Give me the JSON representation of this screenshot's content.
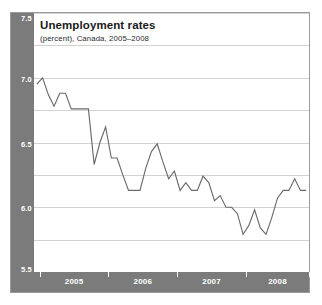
{
  "chart_data": {
    "type": "line",
    "title": "Unemployment rates",
    "subtitle": "(percent), Canada, 2005–2008",
    "xlabel": "",
    "ylabel": "percent",
    "ylim": [
      5.5,
      7.5
    ],
    "yticks": [
      "7.5",
      "7.0",
      "6.5",
      "6.0",
      "5.5"
    ],
    "ytick_values": [
      7.5,
      7.0,
      6.5,
      6.0,
      5.5
    ],
    "gridline_values": [
      7.5,
      7.25,
      7.0,
      6.75,
      6.5,
      6.25,
      6.0,
      5.75,
      5.5
    ],
    "grid": true,
    "legend": "none",
    "xtick_labels": [
      "2005",
      "2006",
      "2007",
      "2008"
    ],
    "xtick_label_positions": [
      6.5,
      18.5,
      30.5,
      42.0
    ],
    "xtick_mark_positions": [
      0.5,
      12.5,
      24.5,
      36.5,
      47.5
    ],
    "line_color": "#6b6b6b",
    "axis_band_color": "#7b7b7b",
    "grid_color": "#d2d2d2",
    "frame_color": "#9a9a9a",
    "background_color": "#ffffff",
    "x": [
      0,
      1,
      2,
      3,
      4,
      5,
      6,
      7,
      8,
      9,
      10,
      11,
      12,
      13,
      14,
      15,
      16,
      17,
      18,
      19,
      20,
      21,
      22,
      23,
      24,
      25,
      26,
      27,
      28,
      29,
      30,
      31,
      32,
      33,
      34,
      35,
      36,
      37,
      38,
      39,
      40,
      41,
      42,
      43,
      44,
      45,
      46,
      47
    ],
    "series": [
      {
        "name": "Unemployment rate",
        "values": [
          6.95,
          7.0,
          6.87,
          6.78,
          6.88,
          6.88,
          6.76,
          6.76,
          6.76,
          6.76,
          6.33,
          6.5,
          6.62,
          6.38,
          6.38,
          6.25,
          6.13,
          6.13,
          6.13,
          6.3,
          6.43,
          6.49,
          6.35,
          6.22,
          6.28,
          6.13,
          6.19,
          6.13,
          6.13,
          6.24,
          6.19,
          6.05,
          6.09,
          6.0,
          6.0,
          5.95,
          5.79,
          5.86,
          5.98,
          5.84,
          5.79,
          5.92,
          6.07,
          6.13,
          6.13,
          6.22,
          6.13,
          6.13
        ]
      }
    ]
  }
}
